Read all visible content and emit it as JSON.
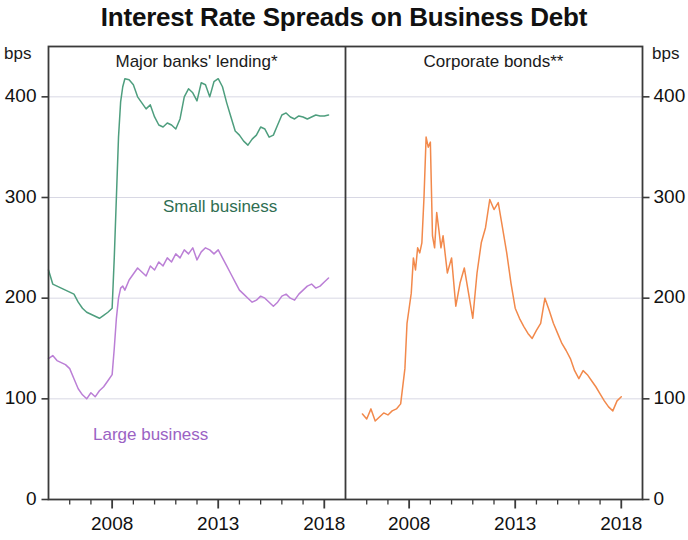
{
  "title": "Interest Rate Spreads on Business Debt",
  "axis_unit_left": "bps",
  "axis_unit_right": "bps",
  "panels": [
    {
      "title": "Major banks' lending*"
    },
    {
      "title": "Corporate bonds**"
    }
  ],
  "labels": {
    "small_business": "Small business",
    "large_business": "Large business"
  },
  "colors": {
    "small_business": "#4e9e7e",
    "large_business": "#bb7fd6",
    "corporate_bonds": "#f2894b",
    "axis": "#3a3a3a",
    "grid": "#d8d8e4",
    "text": "#111111"
  },
  "y_ticks": [
    "0",
    "100",
    "200",
    "300",
    "400"
  ],
  "x_ticks_labelled": [
    "2008",
    "2013",
    "2018"
  ],
  "chart_data": {
    "type": "line",
    "title": "Interest Rate Spreads on Business Debt",
    "ylabel": "bps",
    "xlabel": "",
    "ylim": [
      0,
      450
    ],
    "xlim": [
      2005.0,
      2019.0
    ],
    "grid": true,
    "legend": "inline-labels",
    "panels": [
      {
        "name": "Major banks' lending*",
        "xlim": [
          2005.0,
          2019.0
        ],
        "series": [
          {
            "name": "Small business",
            "color": "#4e9e7e",
            "x": [
              2005.0,
              2005.2,
              2005.4,
              2005.6,
              2005.8,
              2006.0,
              2006.2,
              2006.4,
              2006.6,
              2006.8,
              2007.0,
              2007.2,
              2007.4,
              2007.6,
              2007.8,
              2008.0,
              2008.1,
              2008.2,
              2008.3,
              2008.4,
              2008.5,
              2008.6,
              2008.8,
              2009.0,
              2009.2,
              2009.4,
              2009.6,
              2009.8,
              2010.0,
              2010.2,
              2010.4,
              2010.6,
              2010.8,
              2011.0,
              2011.2,
              2011.4,
              2011.6,
              2011.8,
              2012.0,
              2012.2,
              2012.4,
              2012.6,
              2012.8,
              2013.0,
              2013.2,
              2013.4,
              2013.6,
              2013.8,
              2014.0,
              2014.2,
              2014.4,
              2014.6,
              2014.8,
              2015.0,
              2015.2,
              2015.4,
              2015.6,
              2015.8,
              2016.0,
              2016.2,
              2016.4,
              2016.6,
              2016.8,
              2017.0,
              2017.2,
              2017.4,
              2017.6,
              2017.8,
              2018.0,
              2018.2
            ],
            "y": [
              228,
              214,
              212,
              210,
              208,
              206,
              204,
              196,
              190,
              186,
              184,
              182,
              180,
              183,
              186,
              190,
              240,
              300,
              360,
              395,
              410,
              418,
              417,
              412,
              400,
              394,
              388,
              392,
              380,
              372,
              370,
              374,
              372,
              368,
              378,
              400,
              408,
              404,
              396,
              414,
              412,
              400,
              415,
              418,
              410,
              394,
              380,
              366,
              362,
              356,
              352,
              358,
              362,
              370,
              368,
              360,
              362,
              372,
              382,
              384,
              380,
              378,
              381,
              380,
              378,
              380,
              382,
              381,
              381,
              382
            ]
          },
          {
            "name": "Large business",
            "color": "#bb7fd6",
            "x": [
              2005.0,
              2005.2,
              2005.4,
              2005.6,
              2005.8,
              2006.0,
              2006.2,
              2006.4,
              2006.6,
              2006.8,
              2007.0,
              2007.2,
              2007.4,
              2007.6,
              2007.8,
              2008.0,
              2008.1,
              2008.2,
              2008.3,
              2008.4,
              2008.5,
              2008.6,
              2008.8,
              2009.0,
              2009.2,
              2009.4,
              2009.6,
              2009.8,
              2010.0,
              2010.2,
              2010.4,
              2010.6,
              2010.8,
              2011.0,
              2011.2,
              2011.4,
              2011.6,
              2011.8,
              2012.0,
              2012.2,
              2012.4,
              2012.6,
              2012.8,
              2013.0,
              2013.2,
              2013.4,
              2013.6,
              2013.8,
              2014.0,
              2014.2,
              2014.4,
              2014.6,
              2014.8,
              2015.0,
              2015.2,
              2015.4,
              2015.6,
              2015.8,
              2016.0,
              2016.2,
              2016.4,
              2016.6,
              2016.8,
              2017.0,
              2017.2,
              2017.4,
              2017.6,
              2017.8,
              2018.0,
              2018.2
            ],
            "y": [
              140,
              143,
              138,
              136,
              134,
              130,
              120,
              110,
              104,
              100,
              106,
              102,
              108,
              112,
              118,
              124,
              150,
              180,
              200,
              210,
              212,
              208,
              218,
              224,
              230,
              226,
              222,
              232,
              228,
              236,
              232,
              240,
              236,
              244,
              240,
              248,
              244,
              250,
              238,
              246,
              250,
              248,
              244,
              248,
              240,
              232,
              224,
              216,
              208,
              204,
              200,
              196,
              198,
              202,
              200,
              196,
              192,
              196,
              202,
              204,
              200,
              198,
              204,
              208,
              212,
              214,
              210,
              212,
              216,
              220
            ]
          }
        ]
      },
      {
        "name": "Corporate bonds**",
        "xlim": [
          2005.0,
          2019.0
        ],
        "series": [
          {
            "name": "Corporate bonds",
            "color": "#f2894b",
            "x": [
              2005.8,
              2006.0,
              2006.2,
              2006.4,
              2006.6,
              2006.8,
              2007.0,
              2007.2,
              2007.4,
              2007.6,
              2007.8,
              2007.9,
              2008.0,
              2008.1,
              2008.2,
              2008.3,
              2008.4,
              2008.5,
              2008.6,
              2008.7,
              2008.8,
              2008.9,
              2009.0,
              2009.1,
              2009.2,
              2009.3,
              2009.4,
              2009.5,
              2009.6,
              2009.8,
              2010.0,
              2010.2,
              2010.4,
              2010.6,
              2010.8,
              2011.0,
              2011.2,
              2011.4,
              2011.6,
              2011.8,
              2012.0,
              2012.2,
              2012.4,
              2012.6,
              2012.8,
              2013.0,
              2013.2,
              2013.4,
              2013.6,
              2013.8,
              2014.0,
              2014.2,
              2014.4,
              2014.6,
              2014.8,
              2015.0,
              2015.2,
              2015.4,
              2015.6,
              2015.8,
              2016.0,
              2016.2,
              2016.4,
              2016.6,
              2016.8,
              2017.0,
              2017.2,
              2017.4,
              2017.6,
              2017.8,
              2018.0
            ],
            "y": [
              85,
              80,
              90,
              78,
              82,
              86,
              84,
              88,
              90,
              95,
              130,
              175,
              190,
              205,
              240,
              228,
              250,
              245,
              255,
              300,
              360,
              350,
              355,
              262,
              250,
              285,
              268,
              250,
              262,
              225,
              240,
              192,
              215,
              230,
              205,
              180,
              225,
              255,
              270,
              298,
              288,
              295,
              270,
              245,
              215,
              190,
              180,
              172,
              165,
              160,
              168,
              175,
              200,
              188,
              175,
              165,
              155,
              148,
              140,
              128,
              120,
              128,
              124,
              118,
              112,
              105,
              98,
              92,
              88,
              98,
              102
            ]
          }
        ]
      }
    ]
  }
}
